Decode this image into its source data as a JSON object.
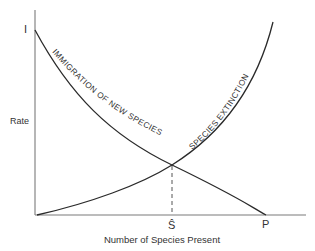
{
  "diagram": {
    "y_axis_label": "Rate",
    "x_axis_label": "Number of Species Present",
    "y_intercept_label": "I",
    "equilibrium_label": "Ŝ",
    "x_intercept_label": "P",
    "curves": [
      {
        "name": "immigration",
        "label": "IMMIGRATION OF NEW SPECIES",
        "trend": "decreasing",
        "from": "I",
        "to": "P"
      },
      {
        "name": "extinction",
        "label": "SPECIES EXTINCTION",
        "trend": "increasing",
        "from": "origin"
      }
    ],
    "intersection": {
      "description": "Equilibrium number of species where immigration = extinction",
      "marker": "dashed vertical line to Ŝ"
    },
    "colors": {
      "line": "#2a2a2a",
      "axis": "#7a7a7a",
      "background": "#ffffff"
    }
  }
}
